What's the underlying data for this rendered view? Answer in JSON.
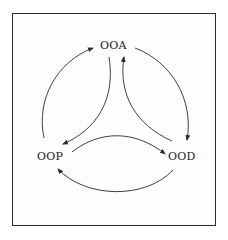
{
  "diagram": {
    "type": "cycle",
    "nodes": [
      {
        "id": "ooa",
        "label": "OOA"
      },
      {
        "id": "ood",
        "label": "OOD"
      },
      {
        "id": "oop",
        "label": "OOP"
      }
    ],
    "edges": [
      {
        "from": "oop",
        "to": "ooa",
        "path": "outer-left"
      },
      {
        "from": "ooa",
        "to": "oop",
        "path": "inner-left"
      },
      {
        "from": "ood",
        "to": "ooa",
        "path": "inner-right"
      },
      {
        "from": "ooa",
        "to": "ood",
        "path": "outer-right"
      },
      {
        "from": "oop",
        "to": "ood",
        "path": "inner-bottom"
      },
      {
        "from": "ood",
        "to": "oop",
        "path": "outer-bottom"
      }
    ],
    "colors": {
      "line": "#2a2a2a",
      "text": "#1a1a1a",
      "background": "#ffffff"
    }
  }
}
